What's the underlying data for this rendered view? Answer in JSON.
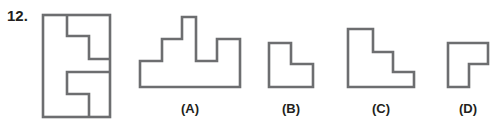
{
  "question": {
    "number": "12.",
    "stroke_color": "#6d6e70"
  },
  "options": [
    {
      "label": "(A)",
      "center_x": 190
    },
    {
      "label": "(B)",
      "center_x": 291
    },
    {
      "label": "(C)",
      "center_x": 381
    },
    {
      "label": "(D)",
      "center_x": 468
    }
  ]
}
